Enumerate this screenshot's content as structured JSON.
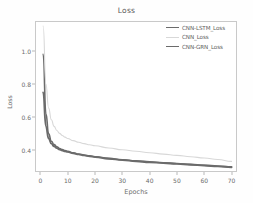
{
  "chart_data": {
    "type": "line",
    "title": "Loss",
    "xlabel": "Epochs",
    "ylabel": "Loss",
    "xlim": [
      -2,
      72
    ],
    "ylim": [
      0.27,
      1.18
    ],
    "xticks": [
      0,
      10,
      20,
      30,
      40,
      50,
      60,
      70
    ],
    "yticks": [
      0.4,
      0.6,
      0.8,
      1.0
    ],
    "ytick_labels": [
      "0.4",
      "0.6",
      "0.8",
      "1.0"
    ],
    "xtick_labels": [
      "0",
      "10",
      "20",
      "30",
      "40",
      "50",
      "60",
      "70"
    ],
    "grid": false,
    "legend_position": "top-right",
    "x": [
      1,
      2,
      3,
      4,
      5,
      6,
      7,
      8,
      9,
      10,
      12,
      14,
      16,
      18,
      20,
      25,
      30,
      35,
      40,
      45,
      50,
      55,
      60,
      65,
      70
    ],
    "series": [
      {
        "name": "CNN-LSTM_Loss",
        "color": "#6b6b6b",
        "linewidth": 1.6,
        "values": [
          0.98,
          0.62,
          0.5,
          0.455,
          0.435,
          0.422,
          0.412,
          0.405,
          0.399,
          0.394,
          0.385,
          0.378,
          0.372,
          0.367,
          0.362,
          0.352,
          0.344,
          0.337,
          0.331,
          0.326,
          0.321,
          0.316,
          0.311,
          0.306,
          0.301
        ]
      },
      {
        "name": "CNN_Loss",
        "color": "#d8d8d8",
        "linewidth": 1.1,
        "values": [
          1.15,
          0.8,
          0.655,
          0.585,
          0.545,
          0.52,
          0.503,
          0.49,
          0.48,
          0.472,
          0.459,
          0.449,
          0.441,
          0.434,
          0.428,
          0.415,
          0.404,
          0.395,
          0.386,
          0.378,
          0.37,
          0.362,
          0.354,
          0.345,
          0.334
        ]
      },
      {
        "name": "CNN-GRN_Loss",
        "color": "#6b6b6b",
        "linewidth": 1.9,
        "values": [
          0.75,
          0.545,
          0.472,
          0.441,
          0.425,
          0.414,
          0.406,
          0.4,
          0.395,
          0.391,
          0.383,
          0.376,
          0.37,
          0.365,
          0.36,
          0.35,
          0.342,
          0.335,
          0.329,
          0.324,
          0.319,
          0.314,
          0.309,
          0.304,
          0.299
        ]
      }
    ]
  },
  "axes": {
    "frame_color": "#c9c9c9"
  }
}
